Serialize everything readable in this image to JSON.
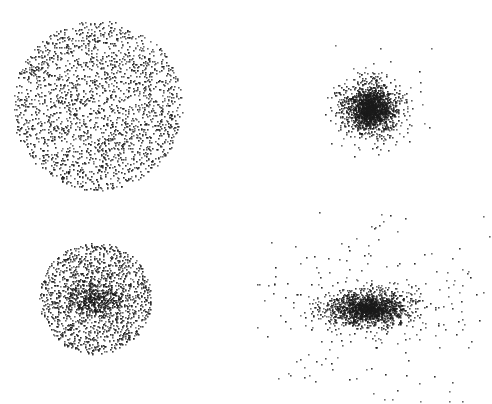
{
  "chart_data": {
    "type": "scatter",
    "title": "",
    "xlabel": "",
    "ylabel": "",
    "grid": false,
    "legend": null,
    "axes_visible": false,
    "point_color": "#1a1a1a",
    "background": "#ffffff",
    "panels": [
      {
        "name": "uniform-disc",
        "position": "top-left",
        "center": [
          97,
          105
        ],
        "distribution": "uniform-disc",
        "radius": 85,
        "points": 2200,
        "core": null,
        "outliers": null
      },
      {
        "name": "compact-cluster",
        "position": "top-right",
        "center": [
          370,
          108
        ],
        "distribution": "gaussian",
        "sigma": [
          14,
          13
        ],
        "points": 1500,
        "core": {
          "sigma": [
            7,
            7
          ],
          "points": 500
        },
        "outliers": {
          "sigma": [
            26,
            24
          ],
          "points": 90
        }
      },
      {
        "name": "disc-with-core",
        "position": "bottom-left",
        "center": [
          95,
          298
        ],
        "distribution": "uniform-disc",
        "radius": 56,
        "points": 1500,
        "core": {
          "sigma": [
            14,
            9
          ],
          "points": 450
        },
        "outliers": null
      },
      {
        "name": "elongated-core-with-halo",
        "position": "bottom-right",
        "center": [
          368,
          308
        ],
        "distribution": "gaussian",
        "sigma": [
          22,
          9
        ],
        "points": 1400,
        "core": {
          "sigma": [
            10,
            5
          ],
          "points": 400
        },
        "outliers": {
          "sigma": [
            70,
            55
          ],
          "points": 230,
          "bounds": [
            250,
            210,
            490,
            402
          ]
        }
      }
    ]
  }
}
